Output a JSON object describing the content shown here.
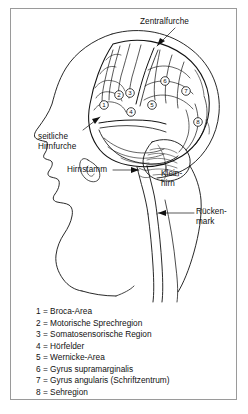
{
  "figure": {
    "background_color": "#ffffff",
    "frame_color": "#9a9a9a",
    "ink_color": "#111111"
  },
  "labels": {
    "zentralfurche": "Zentralfurche",
    "seitliche_hirnfurche_line1": "seitliche",
    "seitliche_hirnfurche_line2": "Hirnfurche",
    "hirnstamm": "Hirnstamm",
    "kleinhirn_line1": "Klein-",
    "kleinhirn_line2": "hirn",
    "rueckenmark_line1": "Rücken-",
    "rueckenmark_line2": "mark"
  },
  "markers": [
    {
      "number": "1",
      "x": 104,
      "y": 105
    },
    {
      "number": "2",
      "x": 119,
      "y": 95
    },
    {
      "number": "3",
      "x": 130,
      "y": 93
    },
    {
      "number": "4",
      "x": 131,
      "y": 112
    },
    {
      "number": "5",
      "x": 152,
      "y": 105
    },
    {
      "number": "6",
      "x": 165,
      "y": 81
    },
    {
      "number": "7",
      "x": 186,
      "y": 91
    },
    {
      "number": "8",
      "x": 198,
      "y": 122
    }
  ],
  "legend": {
    "separator": " = ",
    "items": [
      {
        "key": "1",
        "value": "Broca-Area"
      },
      {
        "key": "2",
        "value": "Motorische Sprechregion"
      },
      {
        "key": "3",
        "value": "Somatosensorische Region"
      },
      {
        "key": "4",
        "value": "Hörfelder"
      },
      {
        "key": "5",
        "value": "Wernicke-Area"
      },
      {
        "key": "6",
        "value": "Gyrus supramarginalis"
      },
      {
        "key": "7",
        "value": "Gyrus angularis (Schriftzentrum)"
      },
      {
        "key": "8",
        "value": "Sehregion"
      }
    ]
  }
}
